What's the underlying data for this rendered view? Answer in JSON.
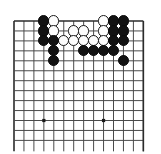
{
  "diagram": {
    "board_type": "go-board",
    "visible_region": "upper-left corner section",
    "columns": 14,
    "rows": 13,
    "grid": {
      "origin_x": 14,
      "origin_y": 21,
      "spacing": 9.95,
      "line_color": "#4a4a4a",
      "edge_color": "#2b2b2b",
      "line_width": 1,
      "edge_width": 1.6,
      "background_color": "#ffffff",
      "grid_on": true
    },
    "stone_radius": 5.6,
    "colors": {
      "black_stone": "#121212",
      "white_stone": "#fdfdfd",
      "white_stone_border": "#1a1a1a",
      "star_point": "#1a1a1a"
    },
    "star_points": [
      {
        "col": 4,
        "row": 11
      },
      {
        "col": 10,
        "row": 11
      }
    ],
    "stones": [
      {
        "col": 4,
        "row": 1,
        "color": "black"
      },
      {
        "col": 5,
        "row": 1,
        "color": "white"
      },
      {
        "col": 10,
        "row": 1,
        "color": "white"
      },
      {
        "col": 11,
        "row": 1,
        "color": "black"
      },
      {
        "col": 12,
        "row": 1,
        "color": "black"
      },
      {
        "col": 4,
        "row": 2,
        "color": "black"
      },
      {
        "col": 5,
        "row": 2,
        "color": "white"
      },
      {
        "col": 7,
        "row": 2,
        "color": "white"
      },
      {
        "col": 8,
        "row": 2,
        "color": "white"
      },
      {
        "col": 10,
        "row": 2,
        "color": "white"
      },
      {
        "col": 11,
        "row": 2,
        "color": "black"
      },
      {
        "col": 12,
        "row": 2,
        "color": "black"
      },
      {
        "col": 4,
        "row": 3,
        "color": "black"
      },
      {
        "col": 5,
        "row": 3,
        "color": "black"
      },
      {
        "col": 6,
        "row": 3,
        "color": "white"
      },
      {
        "col": 7,
        "row": 3,
        "color": "white"
      },
      {
        "col": 8,
        "row": 3,
        "color": "white"
      },
      {
        "col": 9,
        "row": 3,
        "color": "white"
      },
      {
        "col": 10,
        "row": 3,
        "color": "white"
      },
      {
        "col": 11,
        "row": 3,
        "color": "black"
      },
      {
        "col": 12,
        "row": 3,
        "color": "black"
      },
      {
        "col": 5,
        "row": 4,
        "color": "black"
      },
      {
        "col": 8,
        "row": 4,
        "color": "black"
      },
      {
        "col": 9,
        "row": 4,
        "color": "black"
      },
      {
        "col": 10,
        "row": 4,
        "color": "black"
      },
      {
        "col": 11,
        "row": 4,
        "color": "black"
      },
      {
        "col": 5,
        "row": 5,
        "color": "black"
      },
      {
        "col": 12,
        "row": 5,
        "color": "black"
      }
    ]
  }
}
